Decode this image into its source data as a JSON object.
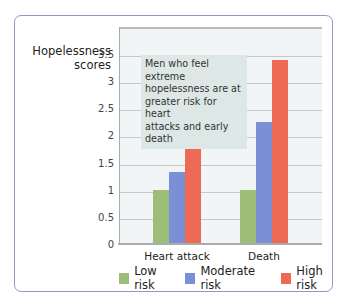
{
  "chart_data": {
    "type": "bar",
    "title": "",
    "annotation": "Men who feel extreme hopelessness are at greater risk for heart attacks and early death",
    "xlabel": "",
    "ylabel": "Hopelessness scores",
    "ylim": [
      0,
      3.8
    ],
    "yticks": [
      "0",
      "0.5",
      "1",
      "1.5",
      "2",
      "2.5",
      "3",
      "3.5"
    ],
    "grid": true,
    "legend_position": "bottom",
    "categories": [
      "Heart attack",
      "Death"
    ],
    "series": [
      {
        "name": "Low risk",
        "color": "#9dbe78",
        "values": [
          1.0,
          1.0
        ]
      },
      {
        "name": "Moderate risk",
        "color": "#7b8fd6",
        "values": [
          1.33,
          2.25
        ]
      },
      {
        "name": "High risk",
        "color": "#ee6a55",
        "values": [
          2.35,
          3.38
        ]
      }
    ]
  },
  "ylabel_lines": [
    "Hopelessness",
    "scores"
  ],
  "annotation_lines": [
    "Men who feel extreme",
    "hopelessness are at",
    "greater risk for heart",
    "attacks and early death"
  ],
  "categories": [
    "Heart attack",
    "Death"
  ],
  "legend": [
    {
      "label": "Low risk",
      "color": "#9dbe78"
    },
    {
      "label": "Moderate risk",
      "color": "#7b8fd6"
    },
    {
      "label": "High risk",
      "color": "#ee6a55"
    }
  ],
  "yticks": [
    "0",
    "0.5",
    "1",
    "1.5",
    "2",
    "2.5",
    "3",
    "3.5"
  ]
}
